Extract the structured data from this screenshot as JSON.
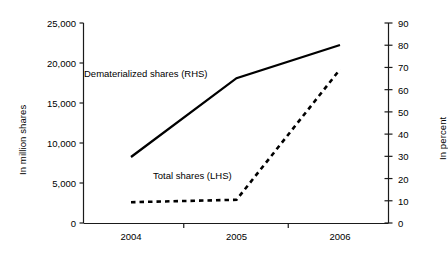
{
  "chart_data": {
    "type": "line",
    "title": "",
    "xlabel": "",
    "ylabel": "In million shares",
    "y2label": "In percent",
    "categories": [
      "2004",
      "2005",
      "2006"
    ],
    "x": [
      2004,
      2005,
      2006
    ],
    "ylim": [
      0,
      25000
    ],
    "y2lim": [
      0,
      90
    ],
    "yticks": [
      0,
      5000,
      10000,
      15000,
      20000,
      25000
    ],
    "ytick_labels": [
      "0",
      "5,000",
      "10,000",
      "15,000",
      "20,000",
      "25,000"
    ],
    "y2ticks": [
      0,
      10,
      20,
      30,
      40,
      50,
      60,
      70,
      80,
      90
    ],
    "y2tick_labels": [
      "0",
      "10",
      "20",
      "30",
      "40",
      "50",
      "60",
      "70",
      "80",
      "90"
    ],
    "grid": false,
    "legend_position": "inline-annotation",
    "series": [
      {
        "name": "Dematerialized shares (RHS)",
        "axis": "left",
        "style": "solid",
        "color": "#000000",
        "values": [
          8250,
          18100,
          22250
        ]
      },
      {
        "name": "Total shares (LHS)",
        "axis": "left",
        "style": "dotted",
        "color": "#000000",
        "values": [
          2600,
          2900,
          19200
        ]
      }
    ],
    "annotations": [
      {
        "text": "Dematerialized shares (RHS)",
        "series": "Dematerialized shares (RHS)"
      },
      {
        "text": "Total shares (LHS)",
        "series": "Total shares (LHS)"
      }
    ]
  },
  "axes": {
    "left_title": "In million shares",
    "right_title": "In percent"
  },
  "colors": {
    "line": "#000000",
    "axis": "#1a1a1a",
    "background": "#ffffff"
  }
}
